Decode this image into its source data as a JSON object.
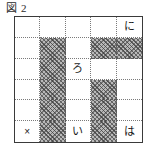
{
  "caption": {
    "badge": "図",
    "number": "2",
    "full": "図 2"
  },
  "diagram": {
    "name": "hatched-grid-puzzle",
    "columns": 5,
    "rows": 6,
    "colors": {
      "frame": "#3a3a3a",
      "gridline": "#7a7a7a",
      "shade_fill": "#b9b9b9",
      "hatch_stroke": "#3c3c3c",
      "background": "#ffffff",
      "text": "#1a1a1a"
    },
    "cells": [
      {
        "row": 1,
        "col": 1,
        "shaded": false,
        "label": ""
      },
      {
        "row": 1,
        "col": 2,
        "shaded": false,
        "label": ""
      },
      {
        "row": 1,
        "col": 3,
        "shaded": false,
        "label": ""
      },
      {
        "row": 1,
        "col": 4,
        "shaded": false,
        "label": ""
      },
      {
        "row": 1,
        "col": 5,
        "shaded": false,
        "label": "に"
      },
      {
        "row": 2,
        "col": 1,
        "shaded": false,
        "label": ""
      },
      {
        "row": 2,
        "col": 2,
        "shaded": true,
        "label": ""
      },
      {
        "row": 2,
        "col": 3,
        "shaded": false,
        "label": ""
      },
      {
        "row": 2,
        "col": 4,
        "shaded": true,
        "label": ""
      },
      {
        "row": 2,
        "col": 5,
        "shaded": true,
        "label": ""
      },
      {
        "row": 3,
        "col": 1,
        "shaded": false,
        "label": ""
      },
      {
        "row": 3,
        "col": 2,
        "shaded": true,
        "label": ""
      },
      {
        "row": 3,
        "col": 3,
        "shaded": false,
        "label": "ろ"
      },
      {
        "row": 3,
        "col": 4,
        "shaded": false,
        "label": ""
      },
      {
        "row": 3,
        "col": 5,
        "shaded": false,
        "label": ""
      },
      {
        "row": 4,
        "col": 1,
        "shaded": false,
        "label": ""
      },
      {
        "row": 4,
        "col": 2,
        "shaded": true,
        "label": ""
      },
      {
        "row": 4,
        "col": 3,
        "shaded": false,
        "label": ""
      },
      {
        "row": 4,
        "col": 4,
        "shaded": true,
        "label": ""
      },
      {
        "row": 4,
        "col": 5,
        "shaded": false,
        "label": ""
      },
      {
        "row": 5,
        "col": 1,
        "shaded": false,
        "label": ""
      },
      {
        "row": 5,
        "col": 2,
        "shaded": true,
        "label": ""
      },
      {
        "row": 5,
        "col": 3,
        "shaded": false,
        "label": ""
      },
      {
        "row": 5,
        "col": 4,
        "shaded": true,
        "label": ""
      },
      {
        "row": 5,
        "col": 5,
        "shaded": false,
        "label": ""
      },
      {
        "row": 6,
        "col": 1,
        "shaded": false,
        "label": "×"
      },
      {
        "row": 6,
        "col": 2,
        "shaded": true,
        "label": ""
      },
      {
        "row": 6,
        "col": 3,
        "shaded": false,
        "label": "い"
      },
      {
        "row": 6,
        "col": 4,
        "shaded": true,
        "label": ""
      },
      {
        "row": 6,
        "col": 5,
        "shaded": false,
        "label": "は"
      }
    ],
    "labels_present": [
      "に",
      "ろ",
      "×",
      "い",
      "は"
    ]
  }
}
